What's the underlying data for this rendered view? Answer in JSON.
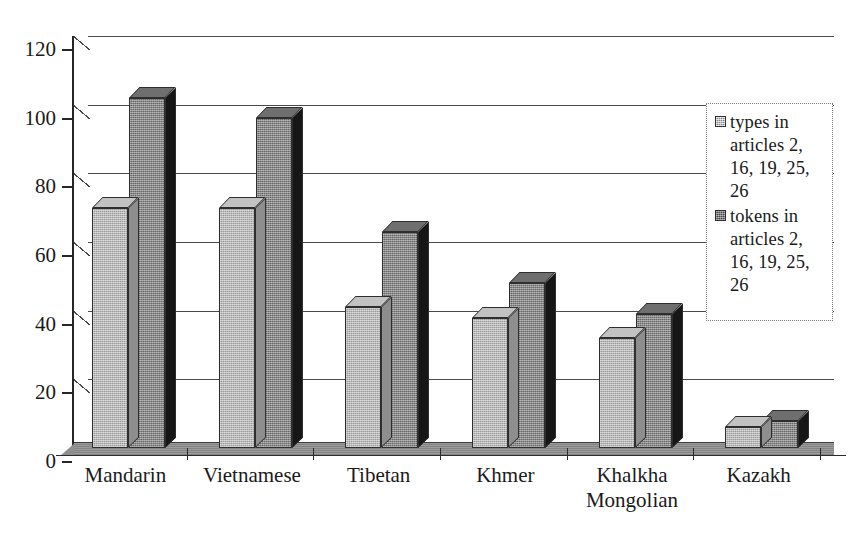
{
  "chart_data": {
    "type": "bar",
    "title": "",
    "subtitle": "",
    "xlabel": "",
    "ylabel": "",
    "ylim": [
      0,
      120
    ],
    "yticks": [
      0,
      20,
      40,
      60,
      80,
      100,
      120
    ],
    "grid": true,
    "legend_position": "right",
    "style": "3d-grouped-bar",
    "categories": [
      "Mandarin",
      "Vietnamese",
      "Tibetan",
      "Khmer",
      "Khalkha\nMongolian",
      "Kazakh"
    ],
    "series": [
      {
        "name": "types in articles 2, 16, 19, 25, 26",
        "short_name": "types",
        "color": "#aaaaaa",
        "values": [
          70,
          70,
          41,
          38,
          32,
          6
        ]
      },
      {
        "name": "tokens in articles 2, 16, 19, 25, 26",
        "short_name": "tokens",
        "color": "#7d7d7d",
        "values": [
          102,
          96,
          63,
          48,
          39,
          8
        ]
      }
    ]
  },
  "legend": {
    "items": [
      {
        "label": "types in articles 2, 16, 19, 25, 26",
        "swatch": "types"
      },
      {
        "label": "tokens in articles 2, 16, 19, 25, 26",
        "swatch": "tokens"
      }
    ]
  },
  "axis": {
    "y_tick_labels": [
      "120",
      "100",
      "80",
      "60",
      "40",
      "20",
      "0"
    ]
  },
  "colors": {
    "series_types": "#aaaaaa",
    "series_tokens": "#7d7d7d",
    "axis": "#262626",
    "gridline": "#4a4a4a",
    "floor": "#8f8f8f",
    "background": "#ffffff"
  }
}
